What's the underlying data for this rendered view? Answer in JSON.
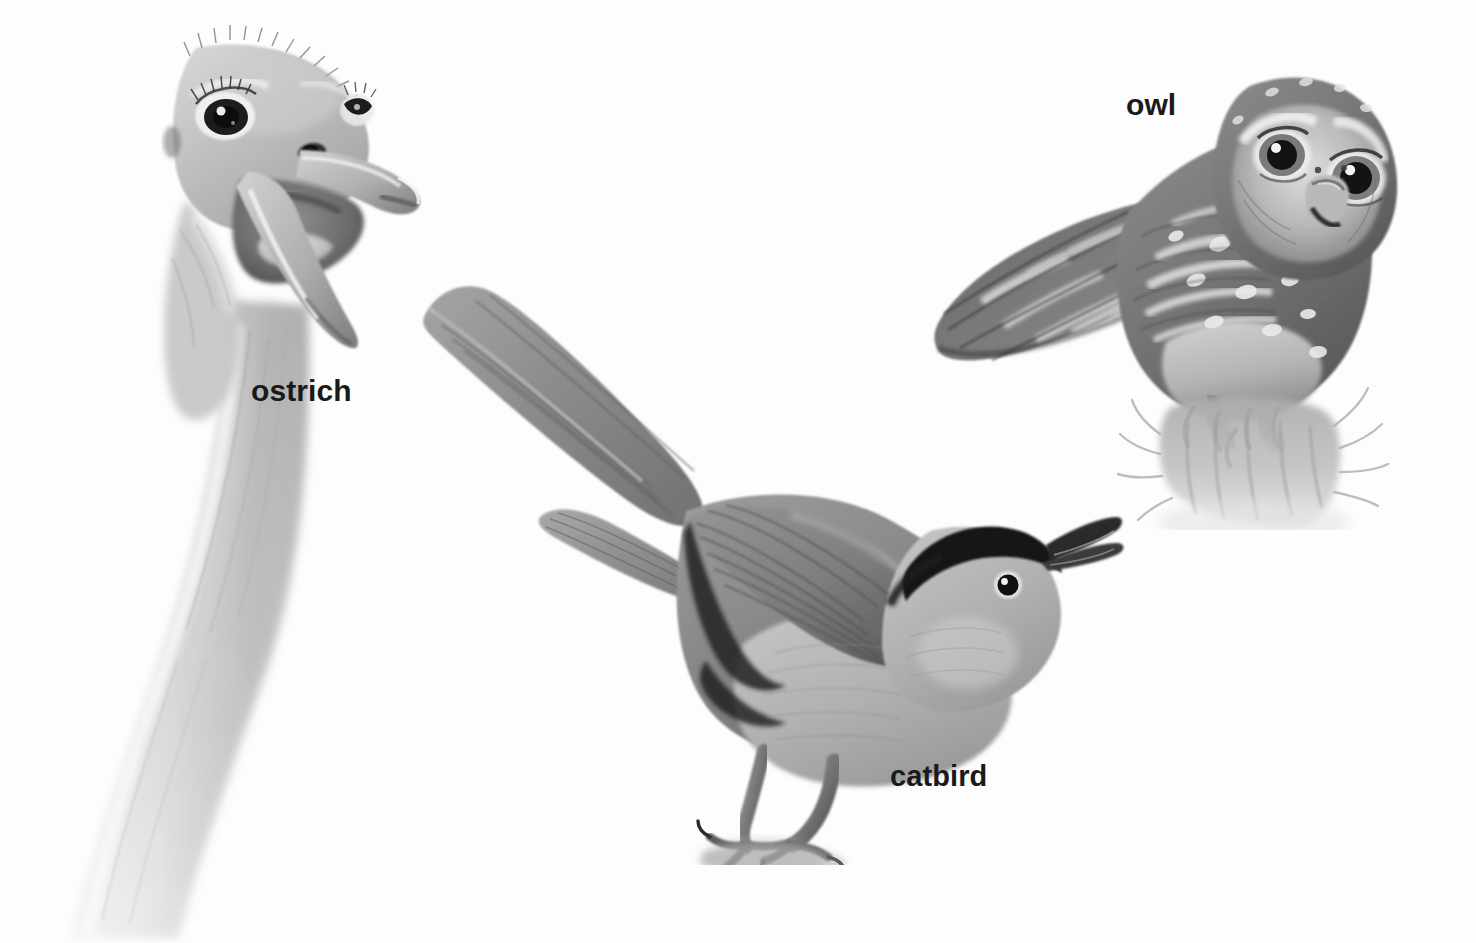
{
  "plate": {
    "kind": "illustration-plate",
    "medium": "graphite pencil drawing, grayscale",
    "background_color": "#fdfdfd",
    "ink_color": "#1a1a1a",
    "width": 1476,
    "height": 943
  },
  "labels": {
    "ostrich": "ostrich",
    "catbird": "catbird",
    "owl": "owl"
  },
  "figures": [
    {
      "name": "ostrich",
      "label": "ostrich",
      "description": "Head and long curving neck of an ostrich with open beak",
      "label_position": {
        "x": 251,
        "y": 374
      },
      "bounds": {
        "x": 20,
        "y": 40,
        "width": 420,
        "height": 900
      },
      "tones": {
        "light": "#e3e3e3",
        "mid": "#b8b8b8",
        "dark": "#6e6e6e",
        "darkest": "#3a3a3a"
      }
    },
    {
      "name": "catbird",
      "label": "catbird",
      "description": "Perched catbird with raised tail, black cap and open bill",
      "label_position": {
        "x": 890,
        "y": 760
      },
      "bounds": {
        "x": 400,
        "y": 280,
        "width": 720,
        "height": 570
      },
      "tones": {
        "light": "#c9c9c9",
        "mid": "#9a9a9a",
        "dark": "#5e5e5e",
        "darkest": "#1f1f1f"
      }
    },
    {
      "name": "owl",
      "label": "owl",
      "description": "Small owl perched on a grassy stump, barred wings and large forward eyes",
      "label_position": {
        "x": 1126,
        "y": 88
      },
      "bounds": {
        "x": 930,
        "y": 40,
        "width": 470,
        "height": 470
      },
      "tones": {
        "light": "#d8d8d8",
        "mid": "#8f8f8f",
        "dark": "#555555",
        "darkest": "#262626"
      }
    }
  ]
}
